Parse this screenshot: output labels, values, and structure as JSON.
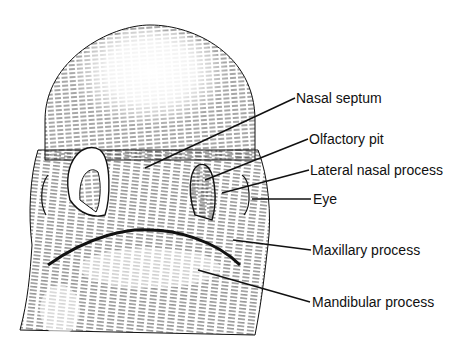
{
  "figure": {
    "labels": [
      {
        "id": "nasal-septum",
        "text": "Nasal septum",
        "x": 296,
        "y": 90,
        "line": [
          295,
          98,
          200,
          162
        ]
      },
      {
        "id": "olfactory-pit",
        "text": "Olfactory pit",
        "x": 309,
        "y": 131,
        "line": [
          308,
          139,
          205,
          180
        ]
      },
      {
        "id": "lateral-nasal-process",
        "text": "Lateral nasal process",
        "x": 310,
        "y": 162,
        "line": [
          309,
          170,
          222,
          193
        ]
      },
      {
        "id": "eye",
        "text": "Eye",
        "x": 313,
        "y": 192,
        "line": [
          311,
          199,
          252,
          199
        ]
      },
      {
        "id": "maxillary-process",
        "text": "Maxillary process",
        "x": 312,
        "y": 242,
        "line": [
          311,
          250,
          235,
          240
        ]
      },
      {
        "id": "mandibular-process",
        "text": "Mandibular process",
        "x": 312,
        "y": 294,
        "line": [
          310,
          302,
          200,
          270
        ]
      }
    ],
    "caption": "",
    "colors": {
      "ink": "#111111",
      "background": "#ffffff"
    }
  }
}
